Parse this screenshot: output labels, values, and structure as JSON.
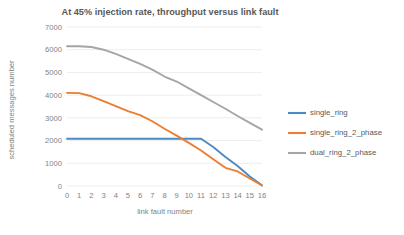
{
  "chart_data": {
    "type": "line",
    "title": "At 45% injection rate, throughput versus link fault",
    "xlabel": "link fault number",
    "ylabel": "scheduled messages number",
    "x": [
      0,
      1,
      2,
      3,
      4,
      5,
      6,
      7,
      8,
      9,
      10,
      11,
      12,
      13,
      14,
      15,
      16
    ],
    "xlim": [
      0,
      16
    ],
    "ylim": [
      0,
      7000
    ],
    "ytick_values": [
      0,
      1000,
      2000,
      3000,
      4000,
      5000,
      6000,
      7000
    ],
    "ytick_labels": [
      "0",
      "1000",
      "2000",
      "3000",
      "4000",
      "5000",
      "6000",
      "7000"
    ],
    "xtick_labels": [
      "0",
      "1",
      "2",
      "3",
      "4",
      "5",
      "6",
      "7",
      "8",
      "9",
      "10",
      "11",
      "12",
      "13",
      "14",
      "15",
      "16"
    ],
    "grid": true,
    "grid_axis": "y",
    "legend_position": "right",
    "series": [
      {
        "name": "single_ring",
        "color": "#4E89C4",
        "values": [
          2080,
          2080,
          2080,
          2080,
          2080,
          2080,
          2080,
          2080,
          2080,
          2080,
          2080,
          2080,
          1720,
          1280,
          880,
          420,
          30
        ]
      },
      {
        "name": "single_ring_2_phase",
        "color": "#ED7D31",
        "values": [
          4100,
          4090,
          3950,
          3740,
          3520,
          3300,
          3120,
          2850,
          2520,
          2220,
          1900,
          1560,
          1180,
          800,
          640,
          330,
          20
        ]
      },
      {
        "name": "dual_ring_2_phase",
        "color": "#A5A5A5",
        "values": [
          6150,
          6150,
          6120,
          6000,
          5820,
          5600,
          5380,
          5120,
          4820,
          4600,
          4300,
          4000,
          3700,
          3400,
          3080,
          2780,
          2480
        ]
      }
    ]
  },
  "legend": {
    "items": [
      {
        "label": "single_ring",
        "color": "#4E89C4"
      },
      {
        "label": "single_ring_2_phase",
        "color": "#ED7D31"
      },
      {
        "label": "dual_ring_2_phase",
        "color": "#A5A5A5"
      }
    ]
  }
}
